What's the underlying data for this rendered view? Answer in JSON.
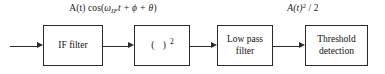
{
  "diagram": {
    "background_color": "#ffffff",
    "line_color": "#2b2b2b",
    "text_color": "#111111",
    "labels": [
      {
        "name": "input-signal-label",
        "text": "A(t) cos(ωIFt + ϕ + θ)",
        "parts": {
          "lead": "A(t) ",
          "cos_open": "cos(",
          "omega": "ω",
          "subscript": "IF",
          "time": "t",
          "phase_terms": " + ϕ + θ",
          "close": ")"
        }
      },
      {
        "name": "output-signal-label",
        "text": "A(t)2 / 2",
        "parts": {
          "lead": "A(t)",
          "exponent": "2",
          "divider": " / 2"
        }
      }
    ],
    "blocks": [
      {
        "name": "if-filter-block",
        "label": "IF filter",
        "lines": [
          "IF filter"
        ]
      },
      {
        "name": "squarer-block",
        "label": "( )2",
        "lines": [
          "( )",
          "2"
        ]
      },
      {
        "name": "low-pass-filter-block",
        "label": "Low pass filter",
        "lines": [
          "Low pass",
          "filter"
        ]
      },
      {
        "name": "threshold-detection-block",
        "label": "Threshold detection",
        "lines": [
          "Threshold",
          "detection"
        ]
      }
    ],
    "connectors": [
      {
        "name": "input-arrow",
        "from": "input",
        "to": "if-filter-block"
      },
      {
        "name": "if-filter-to-squarer-arrow",
        "from": "if-filter-block",
        "to": "squarer-block"
      },
      {
        "name": "squarer-to-low-pass-arrow",
        "from": "squarer-block",
        "to": "low-pass-filter-block"
      },
      {
        "name": "low-pass-to-threshold-arrow",
        "from": "low-pass-filter-block",
        "to": "threshold-detection-block"
      }
    ]
  }
}
